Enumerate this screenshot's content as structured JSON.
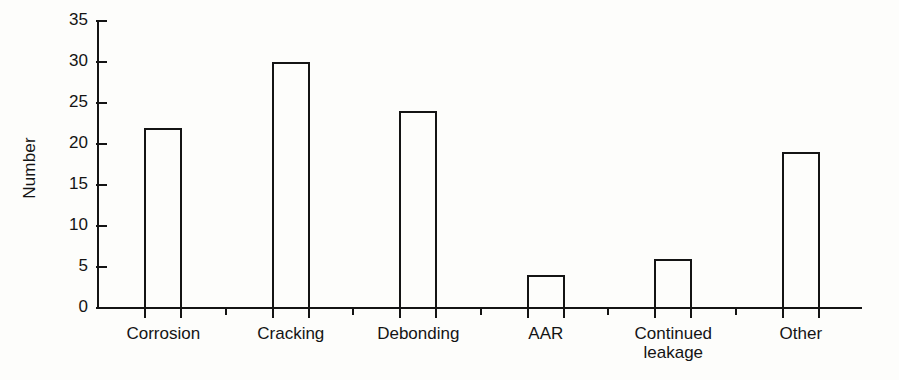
{
  "chart_data": {
    "type": "bar",
    "title": "",
    "subtitle": "",
    "xlabel": "",
    "ylabel": "Number",
    "categories": [
      "Corrosion",
      "Cracking",
      "Debonding",
      "AAR",
      "Continued\nleakage",
      "Other"
    ],
    "values": [
      22,
      30,
      24,
      4,
      6,
      19
    ],
    "ylim": [
      0,
      35
    ],
    "yticks": [
      0,
      5,
      10,
      15,
      20,
      25,
      30,
      35
    ],
    "ytick_labels": [
      "0",
      "5",
      "10",
      "15",
      "20",
      "25",
      "30",
      "35"
    ],
    "grid": false,
    "legend": null,
    "bar_style": {
      "fill": "none",
      "edge_color": "#141414",
      "edge_width": 2
    },
    "background_color": "#fdfdfb",
    "axis_color": "#141414"
  }
}
